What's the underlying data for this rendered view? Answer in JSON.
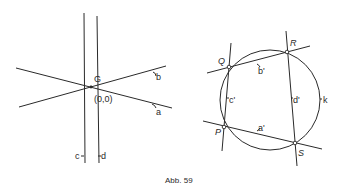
{
  "caption": "Abb. 59",
  "left_figure": {
    "point_label": "G",
    "origin_label": "(0,0)",
    "lines": [
      {
        "name": "a",
        "label": "a"
      },
      {
        "name": "b",
        "label": "b"
      },
      {
        "name": "c",
        "label": "c"
      },
      {
        "name": "d",
        "label": "d"
      }
    ]
  },
  "right_figure": {
    "circle_label": "k",
    "points": [
      {
        "name": "P",
        "label": "P"
      },
      {
        "name": "Q",
        "label": "Q"
      },
      {
        "name": "R",
        "label": "R"
      },
      {
        "name": "S",
        "label": "S"
      }
    ],
    "lines": [
      {
        "name": "a'",
        "label": "a'"
      },
      {
        "name": "b'",
        "label": "b'"
      },
      {
        "name": "c'",
        "label": "c'"
      },
      {
        "name": "d'",
        "label": "d'"
      }
    ]
  },
  "colors": {
    "stroke": "#2a2a2a",
    "background": "#ffffff"
  }
}
